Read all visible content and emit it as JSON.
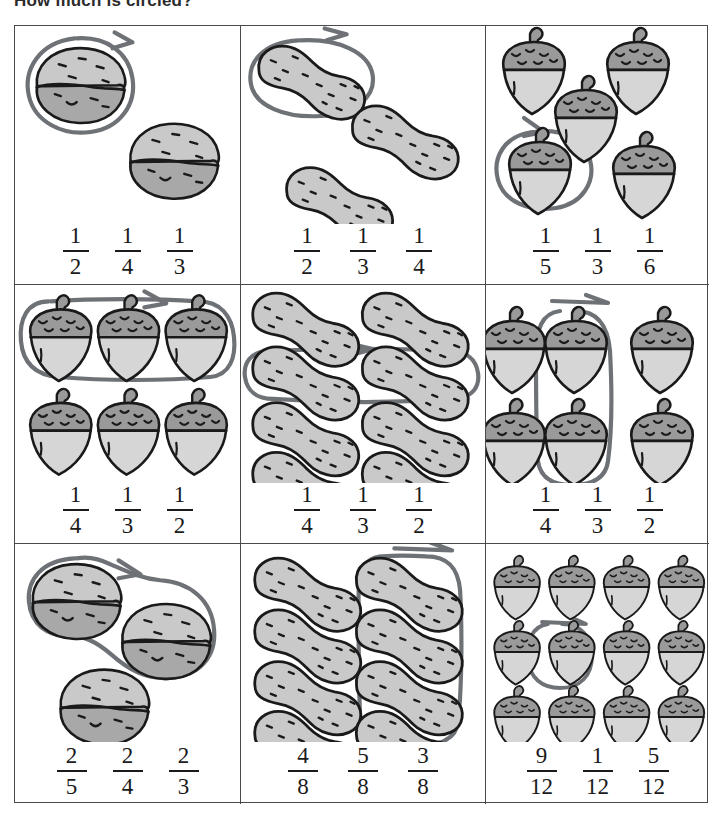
{
  "worksheet": {
    "title": "How much is circled?",
    "ink_color": "#6e7277",
    "nut_fill": "#c9c9c9",
    "nut_cap_fill": "#9a9a9a",
    "outline_color": "#1a1a1a",
    "border_color": "#4a4a4a"
  },
  "problems": [
    {
      "id": 1,
      "object": "walnut",
      "total": 2,
      "circled": 1,
      "layout": "scatter",
      "choices": [
        {
          "numerator": "1",
          "denominator": "2"
        },
        {
          "numerator": "1",
          "denominator": "4"
        },
        {
          "numerator": "1",
          "denominator": "3"
        }
      ]
    },
    {
      "id": 2,
      "object": "peanut",
      "total": 3,
      "circled": 1,
      "layout": "scatter",
      "choices": [
        {
          "numerator": "1",
          "denominator": "2"
        },
        {
          "numerator": "1",
          "denominator": "3"
        },
        {
          "numerator": "1",
          "denominator": "4"
        }
      ]
    },
    {
      "id": 3,
      "object": "acorn",
      "total": 5,
      "circled": 1,
      "layout": "scatter",
      "choices": [
        {
          "numerator": "1",
          "denominator": "5"
        },
        {
          "numerator": "1",
          "denominator": "3"
        },
        {
          "numerator": "1",
          "denominator": "6"
        }
      ]
    },
    {
      "id": 4,
      "object": "acorn",
      "total": 6,
      "circled": 3,
      "layout": "grid-2x3",
      "choices": [
        {
          "numerator": "1",
          "denominator": "4"
        },
        {
          "numerator": "1",
          "denominator": "3"
        },
        {
          "numerator": "1",
          "denominator": "2"
        }
      ]
    },
    {
      "id": 5,
      "object": "peanut",
      "total": 8,
      "circled": 2,
      "layout": "grid-4x2",
      "choices": [
        {
          "numerator": "1",
          "denominator": "4"
        },
        {
          "numerator": "1",
          "denominator": "3"
        },
        {
          "numerator": "1",
          "denominator": "2"
        }
      ]
    },
    {
      "id": 6,
      "object": "acorn",
      "total": 6,
      "circled": 2,
      "layout": "grid-2x3",
      "choices": [
        {
          "numerator": "1",
          "denominator": "4"
        },
        {
          "numerator": "1",
          "denominator": "3"
        },
        {
          "numerator": "1",
          "denominator": "2"
        }
      ]
    },
    {
      "id": 7,
      "object": "walnut",
      "total": 3,
      "circled": 2,
      "layout": "scatter",
      "choices": [
        {
          "numerator": "2",
          "denominator": "5"
        },
        {
          "numerator": "2",
          "denominator": "4"
        },
        {
          "numerator": "2",
          "denominator": "3"
        }
      ]
    },
    {
      "id": 8,
      "object": "peanut",
      "total": 8,
      "circled": 4,
      "layout": "grid-4x2",
      "choices": [
        {
          "numerator": "4",
          "denominator": "8"
        },
        {
          "numerator": "5",
          "denominator": "8"
        },
        {
          "numerator": "3",
          "denominator": "8"
        }
      ]
    },
    {
      "id": 9,
      "object": "acorn",
      "total": 12,
      "circled": 1,
      "layout": "grid-3x4",
      "choices": [
        {
          "numerator": "9",
          "denominator": "12"
        },
        {
          "numerator": "1",
          "denominator": "12"
        },
        {
          "numerator": "5",
          "denominator": "12"
        }
      ]
    }
  ]
}
